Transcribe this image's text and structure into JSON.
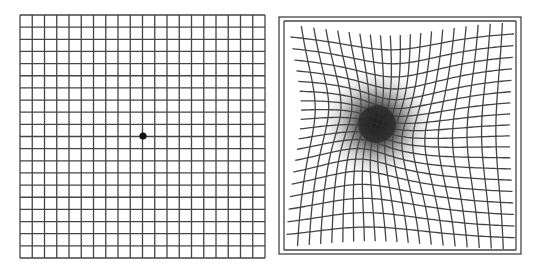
{
  "figure": {
    "width": 533,
    "height": 270,
    "background": "#ffffff",
    "line_color": "#454545",
    "line_width": 1.3
  },
  "normal_grid": {
    "label": "Normal Amsler grid",
    "x": 20,
    "y": 15,
    "width": 245,
    "height": 243,
    "cols": 20,
    "rows": 20,
    "fixation_dot": {
      "cx": 143,
      "cy": 136,
      "r": 3.6,
      "color": "#111111"
    }
  },
  "distorted_grid": {
    "label": "Distorted Amsler grid with central scotoma",
    "outer_border": {
      "x": 279,
      "y": 17,
      "width": 242,
      "height": 237
    },
    "inner": {
      "x": 284,
      "y": 21,
      "width": 232,
      "height": 229
    },
    "cols": 20,
    "rows": 20,
    "distortion_center": {
      "cx": 377,
      "cy": 124
    },
    "distortion_strength": 0.55,
    "distortion_radius": 62,
    "scotoma": {
      "cx": 377,
      "cy": 124,
      "r": 34,
      "color": "#1a1a1a"
    }
  }
}
